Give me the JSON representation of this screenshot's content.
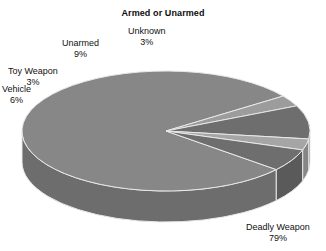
{
  "chart_data": {
    "type": "pie",
    "title": "Armed or Unarmed",
    "xlabel": "",
    "ylabel": "",
    "legend": "none",
    "grid": false,
    "three_d": true,
    "unit": "%",
    "categories": [
      "Deadly Weapon",
      "Unknown",
      "Unarmed",
      "Toy Weapon",
      "Vehicle"
    ],
    "values": [
      79,
      3,
      9,
      3,
      6
    ],
    "slices": [
      {
        "label": "Deadly Weapon",
        "value": 79,
        "pct_text": "79%",
        "top_color": "#878787",
        "side_color": "#6d6d6d",
        "start_deg": 40,
        "end_deg": 324.4
      },
      {
        "label": "Unknown",
        "value": 3,
        "pct_text": "3%",
        "top_color": "#9c9c9c",
        "side_color": "#7d7d7d",
        "start_deg": 324.4,
        "end_deg": 335.2
      },
      {
        "label": "Unarmed",
        "value": 9,
        "pct_text": "9%",
        "top_color": "#6e6e6e",
        "side_color": "#5a5a5a",
        "start_deg": 335.2,
        "end_deg": 7.6
      },
      {
        "label": "Toy Weapon",
        "value": 3,
        "pct_text": "3%",
        "top_color": "#a5a5a5",
        "side_color": "#868686",
        "start_deg": 7.6,
        "end_deg": 18.4
      },
      {
        "label": "Vehicle",
        "value": 6,
        "pct_text": "6%",
        "top_color": "#6e6e6e",
        "side_color": "#5a5a5a",
        "start_deg": 18.4,
        "end_deg": 40
      }
    ],
    "geometry": {
      "cx": 166,
      "cy": 131,
      "rx": 144,
      "ry": 60,
      "depth": 31,
      "edge_color": "#e8e8e8",
      "background": "#ffffff"
    },
    "labels": [
      {
        "name": "Unknown",
        "pct": "3%",
        "x": 128,
        "y": 26,
        "align": "center"
      },
      {
        "name": "Unarmed",
        "pct": "9%",
        "x": 62,
        "y": 38,
        "align": "center"
      },
      {
        "name": "Toy Weapon",
        "pct": "3%",
        "x": 8,
        "y": 66,
        "align": "center"
      },
      {
        "name": "Vehicle",
        "pct": "6%",
        "x": 2,
        "y": 84,
        "align": "center"
      },
      {
        "name": "Deadly Weapon",
        "pct": "79%",
        "x": 246,
        "y": 222,
        "align": "center"
      }
    ]
  }
}
